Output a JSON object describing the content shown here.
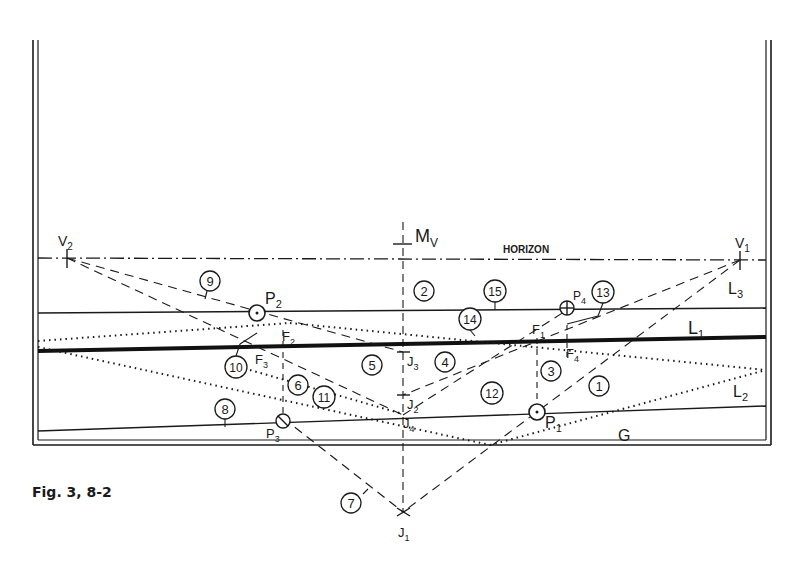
{
  "figure": {
    "caption": "Fig. 3, 8-2",
    "horizon_label": "HORIZON",
    "vanishing_points": {
      "v1": "V",
      "v1_sub": "1",
      "v2": "V",
      "v2_sub": "2"
    },
    "measuring_point": {
      "label": "M",
      "sub": "V"
    },
    "lines": {
      "l1": {
        "label": "L",
        "sub": "1"
      },
      "l2": {
        "label": "L",
        "sub": "2"
      },
      "l3": {
        "label": "L",
        "sub": "3"
      },
      "g": {
        "label": "G"
      }
    },
    "points": {
      "p1": {
        "label": "P",
        "sub": "1"
      },
      "p2": {
        "label": "P",
        "sub": "2"
      },
      "p3": {
        "label": "P",
        "sub": "3"
      },
      "p4": {
        "label": "P",
        "sub": "4"
      },
      "f1": {
        "label": "F",
        "sub": "1"
      },
      "f2": {
        "label": "F",
        "sub": "2"
      },
      "f3": {
        "label": "F",
        "sub": "3"
      },
      "f4": {
        "label": "F",
        "sub": "4"
      },
      "j1": {
        "label": "J",
        "sub": "1"
      },
      "j2": {
        "label": "J",
        "sub": "2"
      },
      "j3": {
        "label": "J",
        "sub": "3"
      },
      "j4": {
        "label": "J",
        "sub": "4"
      }
    },
    "circled_numbers": [
      "1",
      "2",
      "3",
      "4",
      "5",
      "6",
      "7",
      "8",
      "9",
      "10",
      "11",
      "12",
      "13",
      "14",
      "15"
    ]
  }
}
